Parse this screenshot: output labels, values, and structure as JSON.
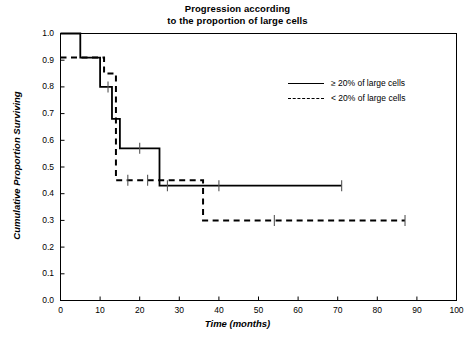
{
  "chart_data": {
    "type": "line",
    "title": "Progression according to the proportion of large cells",
    "title_line1": "Progression according",
    "title_line2": "to the proportion of large cells",
    "xlabel": "Time (months)",
    "ylabel": "Cumulative Proportion Surviving",
    "xlim": [
      0,
      100
    ],
    "ylim": [
      0,
      1.0
    ],
    "xticks": [
      0,
      10,
      20,
      30,
      40,
      50,
      60,
      70,
      80,
      90,
      100
    ],
    "yticks": [
      "0.0",
      "0.1",
      "0.2",
      "0.3",
      "0.4",
      "0.5",
      "0.6",
      "0.7",
      "0.8",
      "0.9",
      "1.0"
    ],
    "grid": false,
    "legend_position": "right-upper-inside",
    "series": [
      {
        "name": "≥ 20% of large cells",
        "style": "solid",
        "color": "#000000",
        "steps": [
          {
            "x": 0,
            "y": 1.0
          },
          {
            "x": 5,
            "y": 1.0
          },
          {
            "x": 5,
            "y": 0.91
          },
          {
            "x": 10,
            "y": 0.91
          },
          {
            "x": 10,
            "y": 0.8
          },
          {
            "x": 13,
            "y": 0.8
          },
          {
            "x": 13,
            "y": 0.68
          },
          {
            "x": 15,
            "y": 0.68
          },
          {
            "x": 15,
            "y": 0.57
          },
          {
            "x": 25,
            "y": 0.57
          },
          {
            "x": 25,
            "y": 0.43
          },
          {
            "x": 71,
            "y": 0.43
          }
        ],
        "censored": [
          {
            "x": 12,
            "y": 0.8
          },
          {
            "x": 20,
            "y": 0.57
          },
          {
            "x": 27,
            "y": 0.43
          },
          {
            "x": 40,
            "y": 0.43
          },
          {
            "x": 71,
            "y": 0.43
          }
        ]
      },
      {
        "name": "< 20% of large cells",
        "style": "dashed",
        "color": "#000000",
        "steps": [
          {
            "x": 0,
            "y": 0.91
          },
          {
            "x": 11,
            "y": 0.91
          },
          {
            "x": 11,
            "y": 0.85
          },
          {
            "x": 14,
            "y": 0.85
          },
          {
            "x": 14,
            "y": 0.45
          },
          {
            "x": 36,
            "y": 0.45
          },
          {
            "x": 36,
            "y": 0.3
          },
          {
            "x": 87,
            "y": 0.3
          }
        ],
        "censored": [
          {
            "x": 17,
            "y": 0.45
          },
          {
            "x": 22,
            "y": 0.45
          },
          {
            "x": 54,
            "y": 0.3
          },
          {
            "x": 87,
            "y": 0.3
          }
        ]
      }
    ]
  },
  "legend": {
    "items": [
      {
        "label": "≥ 20% of large cells",
        "style": "solid"
      },
      {
        "label": "< 20% of large cells",
        "style": "dashed"
      }
    ]
  }
}
